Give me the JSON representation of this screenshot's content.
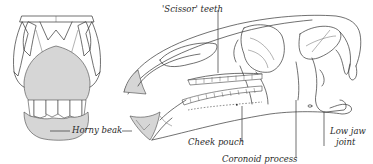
{
  "diagram": {
    "views": [
      "front-view",
      "side-view"
    ],
    "colors": {
      "line": "#333333",
      "beak_fill": "#d6d6d6",
      "background": "#ffffff"
    },
    "labels": {
      "scissor_teeth": "'Scissor' teeth",
      "horny_beak": "Horny beak",
      "cheek_pouch": "Cheek pouch",
      "coronoid_process": "Coronoid process",
      "low_jaw_joint_line1": "Low jaw",
      "low_jaw_joint_line2": "joint"
    }
  }
}
